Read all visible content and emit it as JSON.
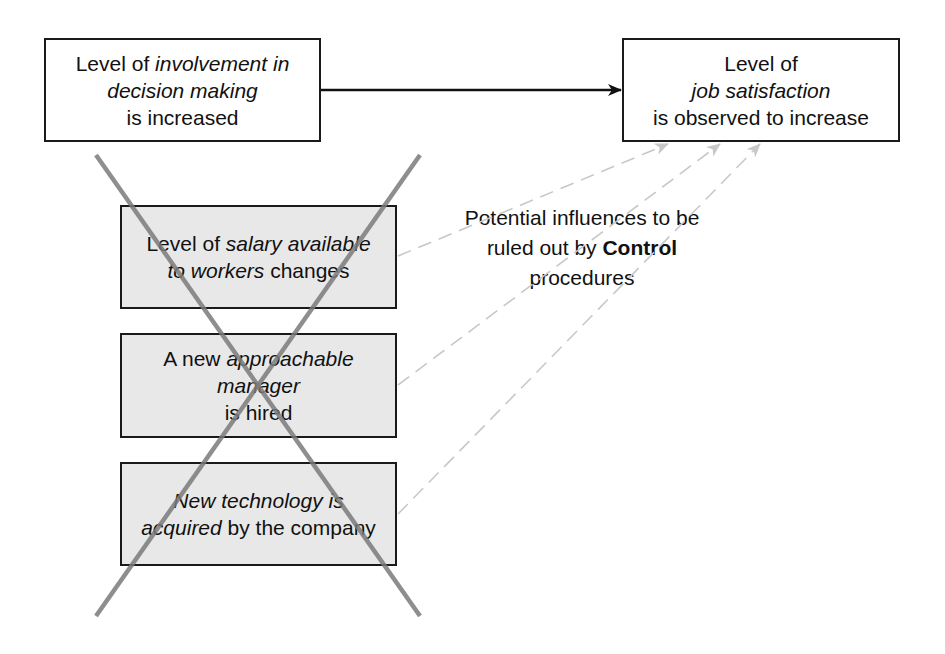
{
  "diagram": {
    "cause_box": {
      "lines": [
        {
          "plain1": "Level of ",
          "italic": "involvement in",
          "plain2": ""
        },
        {
          "plain1": "",
          "italic": "decision making",
          "plain2": ""
        },
        {
          "plain1": "is increased",
          "italic": "",
          "plain2": ""
        }
      ]
    },
    "effect_box": {
      "lines": [
        {
          "plain1": "Level of",
          "italic": "",
          "plain2": ""
        },
        {
          "plain1": "",
          "italic": "job satisfaction",
          "plain2": ""
        },
        {
          "plain1": "is observed to increase",
          "italic": "",
          "plain2": ""
        }
      ]
    },
    "confounds": [
      {
        "lines": [
          {
            "plain1": "Level of ",
            "italic": "salary available",
            "plain2": ""
          },
          {
            "plain1": "",
            "italic": "to workers",
            "plain2": " changes"
          }
        ]
      },
      {
        "lines": [
          {
            "plain1": "A new ",
            "italic": "approachable",
            "plain2": ""
          },
          {
            "plain1": "",
            "italic": "manager",
            "plain2": ""
          },
          {
            "plain1": "is hired",
            "italic": "",
            "plain2": ""
          }
        ]
      },
      {
        "lines": [
          {
            "plain1": "",
            "italic": "New technology is",
            "plain2": ""
          },
          {
            "plain1": "",
            "italic": "acquired",
            "plain2": " by the company"
          }
        ]
      }
    ],
    "annotation": {
      "line1": "Potential influences to be",
      "line2_plain": "ruled out by ",
      "line2_bold": "Control",
      "line3": "procedures"
    },
    "colors": {
      "box_border": "#1a1a1a",
      "confound_fill": "#e8e8e8",
      "cross": "#808080",
      "dashed_arrow": "#c8c8c8",
      "main_arrow": "#111111"
    }
  }
}
